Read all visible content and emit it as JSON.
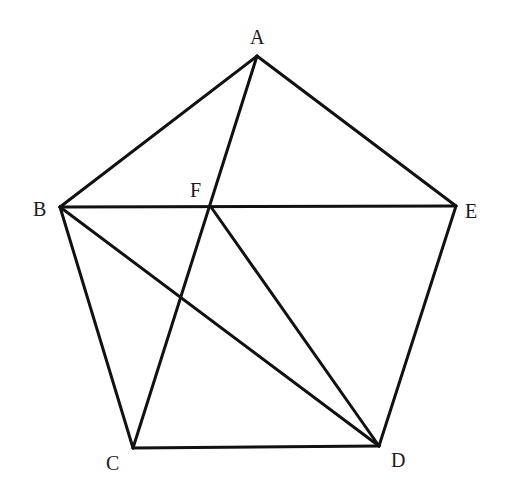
{
  "diagram": {
    "type": "geometry",
    "shape": "pentagon ABCDE with diagonals",
    "stroke_color": "#111111",
    "points": {
      "A": {
        "x": 257,
        "y": 56
      },
      "B": {
        "x": 60,
        "y": 207
      },
      "C": {
        "x": 133,
        "y": 448
      },
      "D": {
        "x": 379,
        "y": 446
      },
      "E": {
        "x": 456,
        "y": 206
      },
      "F": {
        "x": 211,
        "y": 207
      }
    },
    "labels": {
      "A": "A",
      "B": "B",
      "C": "C",
      "D": "D",
      "E": "E",
      "F": "F"
    },
    "segments": [
      [
        "A",
        "B"
      ],
      [
        "B",
        "C"
      ],
      [
        "C",
        "D"
      ],
      [
        "D",
        "E"
      ],
      [
        "E",
        "A"
      ],
      [
        "B",
        "E"
      ],
      [
        "A",
        "C"
      ],
      [
        "B",
        "D"
      ],
      [
        "F",
        "D"
      ]
    ]
  }
}
